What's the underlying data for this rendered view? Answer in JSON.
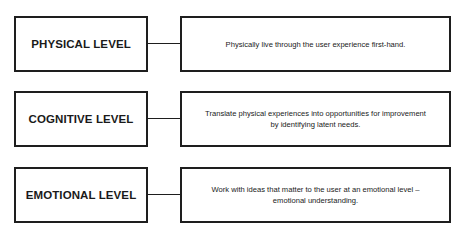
{
  "diagram": {
    "type": "level-mapping",
    "levels": [
      {
        "label": "PHYSICAL LEVEL",
        "description": "Physically live through the user experience first-hand."
      },
      {
        "label": "COGNITIVE LEVEL",
        "description": "Translate physical experiences into opportunities for improvement by identifying latent needs."
      },
      {
        "label": "EMOTIONAL LEVEL",
        "description": "Work with ideas that matter to the user at an emotional level – emotional understanding."
      }
    ],
    "colors": {
      "border": "#1e1e1e",
      "text": "#1a1a1a",
      "background": "#ffffff"
    }
  }
}
